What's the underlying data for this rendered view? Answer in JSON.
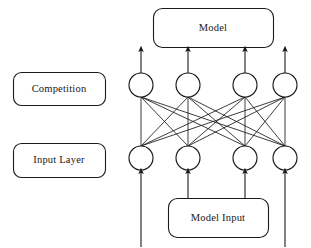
{
  "diagram": {
    "background_color": "#ffffff",
    "stroke_color": "#1a1a1a",
    "text_color": "#171717",
    "boxes": [
      {
        "id": "model",
        "label": "Model",
        "x": 153,
        "y": 8,
        "w": 120,
        "h": 39,
        "radius": 9
      },
      {
        "id": "competition",
        "label": "Competition",
        "x": 13,
        "y": 72,
        "w": 92,
        "h": 33,
        "radius": 8
      },
      {
        "id": "input_layer",
        "label": "Input Layer",
        "x": 13,
        "y": 143,
        "w": 92,
        "h": 34,
        "radius": 8
      },
      {
        "id": "model_input",
        "label": "Model Input",
        "x": 168,
        "y": 198,
        "w": 100,
        "h": 39,
        "radius": 9
      }
    ],
    "layers": [
      {
        "id": "competition_layer",
        "name": "Competition",
        "node_count": 4,
        "cy": 85,
        "radius": 12,
        "node_cx": [
          141,
          188,
          245,
          285
        ]
      },
      {
        "id": "input_layer_nodes",
        "name": "Input Layer",
        "node_count": 4,
        "cy": 158,
        "radius": 12,
        "node_cx": [
          141,
          188,
          245,
          285
        ]
      }
    ],
    "connections": {
      "type": "fully-connected-bipartite",
      "from_layer": "input_layer_nodes",
      "to_layer": "competition_layer",
      "edge_count": 16,
      "directed": false
    },
    "output_arrows": {
      "count": 4,
      "from_y": 73,
      "to_y": 49,
      "x": [
        141,
        188,
        245,
        285
      ],
      "direction": "up",
      "target": "model"
    },
    "input_arrows": {
      "count": 4,
      "to_y": 171,
      "direction": "up",
      "source": "model_input",
      "arrows": [
        {
          "x": 141,
          "from_y": 247
        },
        {
          "x": 188,
          "from_y": 198
        },
        {
          "x": 245,
          "from_y": 198
        },
        {
          "x": 285,
          "from_y": 247
        }
      ]
    }
  }
}
